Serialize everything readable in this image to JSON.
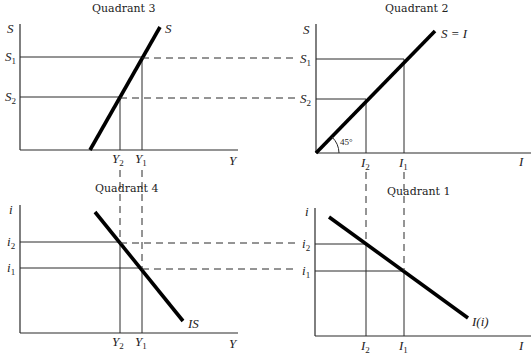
{
  "figure": {
    "quadrant3": {
      "title": "Quadrant 3",
      "y_axis_label": "S",
      "x_axis_label": "Y",
      "curve_label": "S",
      "y_ticks": [
        {
          "base": "S",
          "sub": "1"
        },
        {
          "base": "S",
          "sub": "2"
        }
      ],
      "x_ticks": [
        {
          "base": "Y",
          "sub": "2"
        },
        {
          "base": "Y",
          "sub": "1"
        }
      ]
    },
    "quadrant2": {
      "title": "Quadrant 2",
      "y_axis_label": "S",
      "x_axis_label": "I",
      "curve_label": "S = I",
      "angle_label": "45°",
      "y_ticks": [
        {
          "base": "S",
          "sub": "1"
        },
        {
          "base": "S",
          "sub": "2"
        }
      ],
      "x_ticks": [
        {
          "base": "I",
          "sub": "2"
        },
        {
          "base": "I",
          "sub": "1"
        }
      ]
    },
    "quadrant4": {
      "title": "Quadrant 4",
      "y_axis_label": "i",
      "x_axis_label": "Y",
      "curve_label": "IS",
      "y_ticks": [
        {
          "base": "i",
          "sub": "2"
        },
        {
          "base": "i",
          "sub": "1"
        }
      ],
      "x_ticks": [
        {
          "base": "Y",
          "sub": "2"
        },
        {
          "base": "Y",
          "sub": "1"
        }
      ]
    },
    "quadrant1": {
      "title": "Quadrant 1",
      "y_axis_label": "i",
      "x_axis_label": "I",
      "curve_label": "I(i)",
      "y_ticks": [
        {
          "base": "i",
          "sub": "2"
        },
        {
          "base": "i",
          "sub": "1"
        }
      ],
      "x_ticks": [
        {
          "base": "I",
          "sub": "2"
        },
        {
          "base": "I",
          "sub": "1"
        }
      ]
    },
    "colors": {
      "line": "#000000",
      "axis": "#2a2a2a",
      "background": "#ffffff"
    }
  }
}
